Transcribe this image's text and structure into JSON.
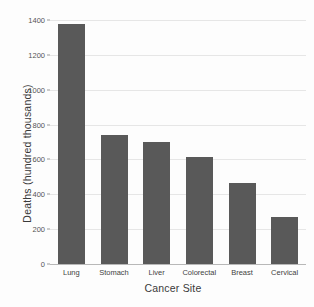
{
  "chart_data": {
    "type": "bar",
    "title": "",
    "xlabel": "Cancer Site",
    "ylabel": "Deaths (hundred thousands)",
    "categories": [
      "Lung",
      "Stomach",
      "Liver",
      "Colorectal",
      "Breast",
      "Cervical"
    ],
    "values": [
      1375,
      740,
      700,
      615,
      465,
      270
    ],
    "ylim": [
      0,
      1400
    ],
    "yticks": [
      0,
      200,
      400,
      600,
      800,
      1000,
      1200,
      1400
    ],
    "ytick_labels": [
      "0",
      "200",
      "400",
      "600",
      "800",
      "1000",
      "1200",
      "1400"
    ],
    "grid": true,
    "legend": "none",
    "bar_color": "#595959",
    "background_color": "#fdfdfd",
    "gridline_color": "#e6e6e6",
    "axis_color": "#b8b8b8"
  },
  "axes": {
    "x_title": "Cancer Site",
    "y_title": "Deaths (hundred thousands)"
  }
}
